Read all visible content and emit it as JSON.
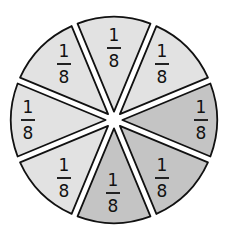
{
  "diagram": {
    "type": "fraction-circle",
    "center": [
      114,
      120
    ],
    "radius": 103,
    "colors": {
      "light": "#e2e2e2",
      "shaded": "#c4c4c4",
      "outline": "#111111",
      "gap": "#ffffff"
    },
    "slices": [
      {
        "id": "right",
        "center_angle": 0,
        "shaded": true,
        "numerator": "1",
        "denominator": "8",
        "label_pos": [
          201,
          120
        ]
      },
      {
        "id": "bottom-right",
        "center_angle": 45,
        "shaded": true,
        "numerator": "1",
        "denominator": "8",
        "label_pos": [
          162,
          178
        ]
      },
      {
        "id": "bottom",
        "center_angle": 90,
        "shaded": true,
        "numerator": "1",
        "denominator": "8",
        "label_pos": [
          113,
          193
        ]
      },
      {
        "id": "bottom-left",
        "center_angle": 135,
        "shaded": false,
        "numerator": "1",
        "denominator": "8",
        "label_pos": [
          64,
          178
        ]
      },
      {
        "id": "left",
        "center_angle": 180,
        "shaded": false,
        "numerator": "1",
        "denominator": "8",
        "label_pos": [
          28,
          120
        ]
      },
      {
        "id": "top-left",
        "center_angle": 225,
        "shaded": false,
        "numerator": "1",
        "denominator": "8",
        "label_pos": [
          64,
          64
        ]
      },
      {
        "id": "top",
        "center_angle": 270,
        "shaded": false,
        "numerator": "1",
        "denominator": "8",
        "label_pos": [
          114,
          48
        ]
      },
      {
        "id": "top-right",
        "center_angle": 315,
        "shaded": false,
        "numerator": "1",
        "denominator": "8",
        "label_pos": [
          162,
          64
        ]
      }
    ],
    "shaded_count": 3,
    "total_parts": 8
  }
}
